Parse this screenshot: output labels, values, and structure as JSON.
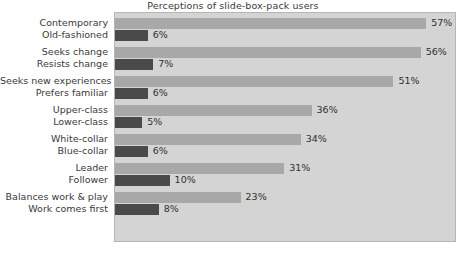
{
  "chart_data": {
    "type": "bar",
    "orientation": "horizontal",
    "title": "Perceptions of slide-box-pack users",
    "xlabel": "",
    "ylabel": "",
    "xlim": [
      0,
      62
    ],
    "grid": false,
    "legend": "none",
    "value_suffix": "%",
    "categories": [
      "Contemporary",
      "Old-fashioned",
      "Seeks change",
      "Resists change",
      "Seeks new experiences",
      "Prefers familiar",
      "Upper-class",
      "Lower-class",
      "White-collar",
      "Blue-collar",
      "Leader",
      "Follower",
      "Balances work & play",
      "Work comes first"
    ],
    "values": [
      57,
      6,
      56,
      7,
      51,
      6,
      36,
      5,
      34,
      6,
      31,
      10,
      23,
      8
    ],
    "value_labels": [
      "57%",
      "6%",
      "56%",
      "7%",
      "51%",
      "6%",
      "36%",
      "5%",
      "34%",
      "6%",
      "31%",
      "10%",
      "23%",
      "8%"
    ],
    "bar_colors": [
      "#a8a8a8",
      "#4a4a4a",
      "#a8a8a8",
      "#4a4a4a",
      "#a8a8a8",
      "#4a4a4a",
      "#a8a8a8",
      "#4a4a4a",
      "#a8a8a8",
      "#4a4a4a",
      "#a8a8a8",
      "#4a4a4a",
      "#a8a8a8",
      "#4a4a4a"
    ],
    "pairs": [
      {
        "positive": {
          "label": "Contemporary",
          "value": 57,
          "value_label": "57%",
          "style": "light"
        },
        "negative": {
          "label": "Old-fashioned",
          "value": 6,
          "value_label": "6%",
          "style": "dark"
        }
      },
      {
        "positive": {
          "label": "Seeks change",
          "value": 56,
          "value_label": "56%",
          "style": "light"
        },
        "negative": {
          "label": "Resists change",
          "value": 7,
          "value_label": "7%",
          "style": "dark"
        }
      },
      {
        "positive": {
          "label": "Seeks new experiences",
          "value": 51,
          "value_label": "51%",
          "style": "light"
        },
        "negative": {
          "label": "Prefers familiar",
          "value": 6,
          "value_label": "6%",
          "style": "dark"
        }
      },
      {
        "positive": {
          "label": "Upper-class",
          "value": 36,
          "value_label": "36%",
          "style": "light"
        },
        "negative": {
          "label": "Lower-class",
          "value": 5,
          "value_label": "5%",
          "style": "dark"
        }
      },
      {
        "positive": {
          "label": "White-collar",
          "value": 34,
          "value_label": "34%",
          "style": "light"
        },
        "negative": {
          "label": "Blue-collar",
          "value": 6,
          "value_label": "6%",
          "style": "dark"
        }
      },
      {
        "positive": {
          "label": "Leader",
          "value": 31,
          "value_label": "31%",
          "style": "light"
        },
        "negative": {
          "label": "Follower",
          "value": 10,
          "value_label": "10%",
          "style": "dark"
        }
      },
      {
        "positive": {
          "label": "Balances work & play",
          "value": 23,
          "value_label": "23%",
          "style": "light"
        },
        "negative": {
          "label": "Work comes first",
          "value": 8,
          "value_label": "8%",
          "style": "dark"
        }
      }
    ],
    "colors": {
      "plot_background": "#d4d4d4",
      "page_background": "#ffffff",
      "plot_border": "#b6b6b6",
      "light_bar": "#a8a8a8",
      "dark_bar": "#4a4a4a",
      "text": "#3a3a3a"
    },
    "layout": {
      "px_per_unit": 5.46,
      "bar_height_px": 11,
      "group_pitch_px": 29,
      "first_bar_top_px": 5
    }
  }
}
